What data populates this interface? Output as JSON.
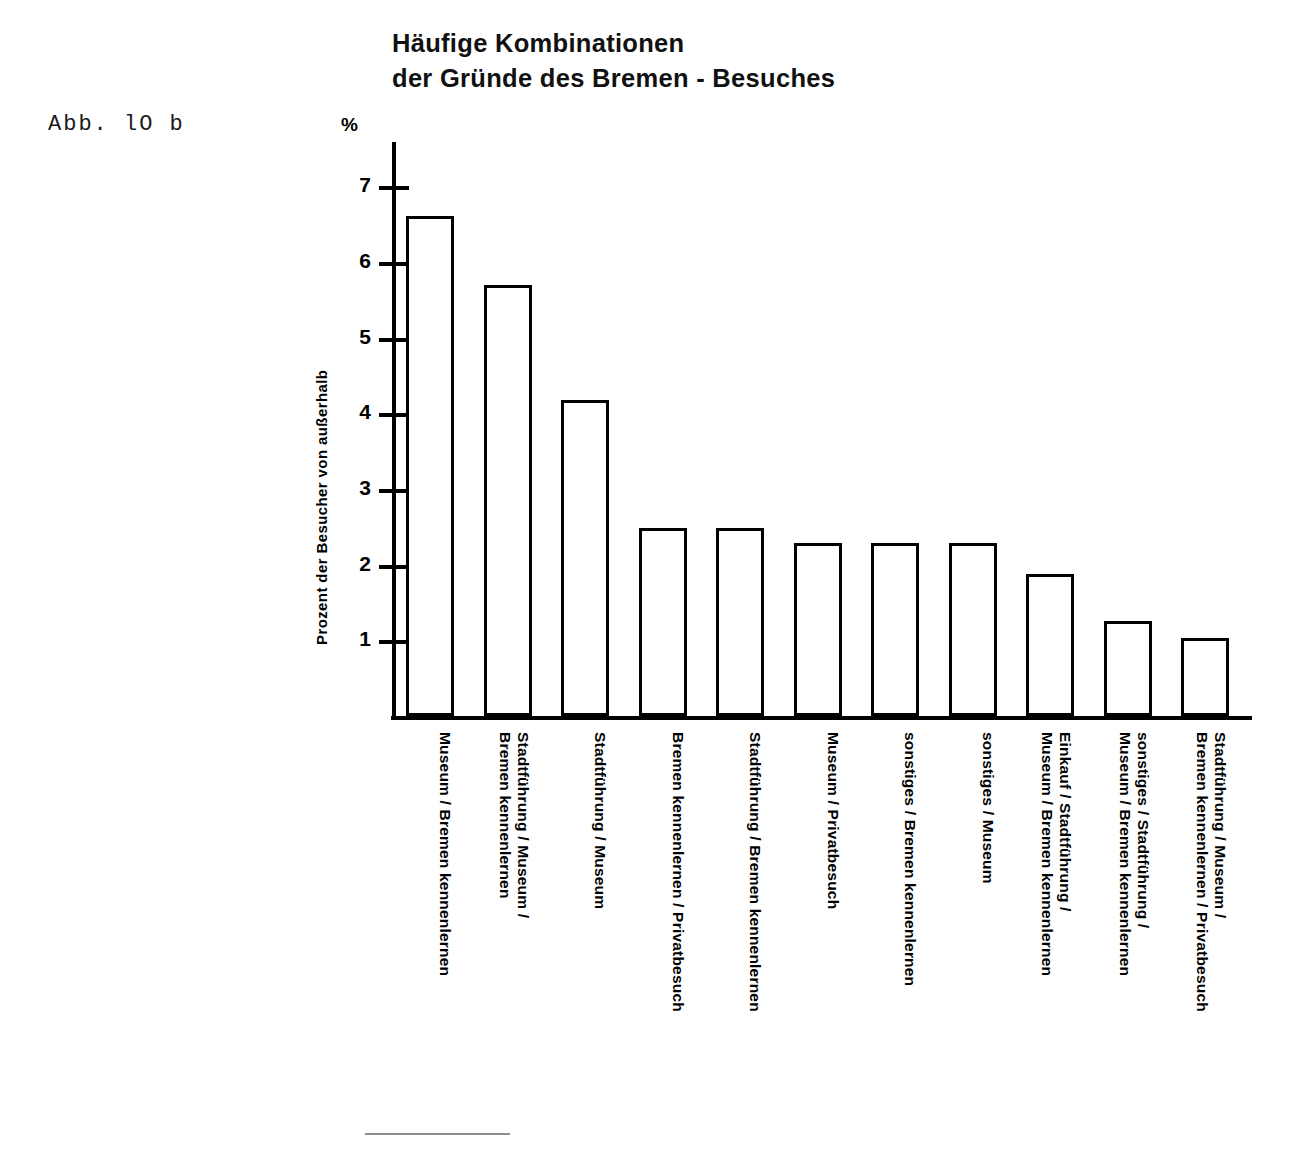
{
  "figure": {
    "label": "Abb. lO b"
  },
  "chart_data": {
    "type": "bar",
    "title": "Häufige Kombinationen der Gründe des Bremen - Besuches",
    "title_lines": [
      "Häufige Kombinationen",
      "der Gründe des Bremen - Besuches"
    ],
    "ylabel": "Prozent der Besucher von außerhalb",
    "yunit": "%",
    "xlabel": "",
    "ylim": [
      0,
      7.4
    ],
    "yticks": [
      1,
      2,
      3,
      4,
      5,
      6,
      7
    ],
    "ytick_labels": [
      "1",
      "2",
      "3",
      "4",
      "5",
      "6",
      "7"
    ],
    "grid": false,
    "legend": "none",
    "bar_fill": "#ffffff",
    "bar_stroke": "#000000",
    "categories": [
      "Museum / Bremen kennenlernen",
      "Stadtführung / Museum / Bremen kennenlernen",
      "Stadtführung / Museum",
      "Bremen kennenlernen / Privatbesuch",
      "Stadtführung / Bremen kennenlernen",
      "Museum / Privatbesuch",
      "sonstiges / Bremen kennenlernen",
      "sonstiges / Museum",
      "Einkauf / Stadtführung / Museum / Bremen kennenlernen",
      "sonstiges / Stadtführung / Museum / Bremen kennenlernen",
      "Stadtführung / Museum / Bremen kennenlernen / Privatbesuch"
    ],
    "category_lines": [
      [
        "Museum / Bremen kennenlernen"
      ],
      [
        "Stadtführung / Museum /",
        "Bremen kennenlernen"
      ],
      [
        "Stadtführung / Museum"
      ],
      [
        "Bremen kennenlernen / Privatbesuch"
      ],
      [
        "Stadtführung / Bremen kennenlernen"
      ],
      [
        "Museum / Privatbesuch"
      ],
      [
        "sonstiges / Bremen kennenlernen"
      ],
      [
        "sonstiges / Museum"
      ],
      [
        "Einkauf / Stadtführung /",
        "Museum / Bremen kennenlernen"
      ],
      [
        "sonstiges / Stadtführung /",
        "Museum / Bremen kennenlernen"
      ],
      [
        "Stadtführung / Museum /",
        "Bremen kennenlernen / Privatbesuch"
      ]
    ],
    "values": [
      6.6,
      5.7,
      4.18,
      2.48,
      2.48,
      2.28,
      2.28,
      2.28,
      1.87,
      1.25,
      1.03
    ]
  }
}
